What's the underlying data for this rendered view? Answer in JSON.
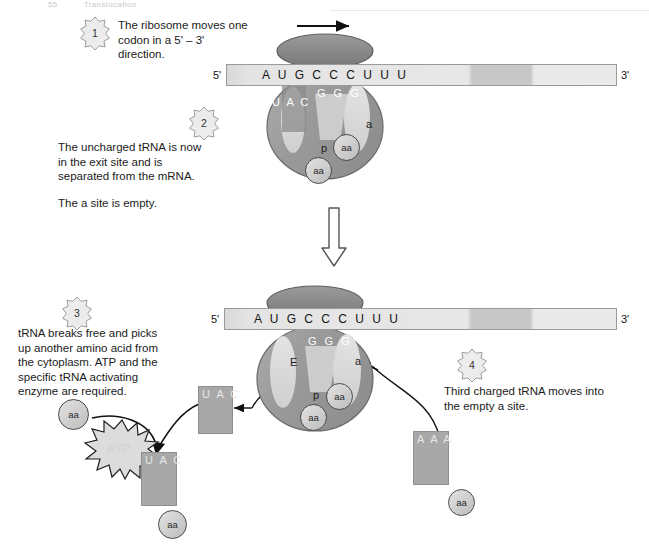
{
  "header": {
    "number": "55",
    "title": "Translocation"
  },
  "steps": [
    {
      "num": "1",
      "text": "The ribosome moves one\ncodon in a 5' – 3'\ndirection."
    },
    {
      "num": "2",
      "text": "The uncharged tRNA is now\nin the exit site and is\nseparated from the mRNA."
    },
    {
      "num": "3",
      "text": "tRNA breaks free and picks\nup another amino acid from\nthe cytoplasm. ATP and the\nspecific tRNA activating\nenzyme are required."
    },
    {
      "num": "4",
      "text": "Third charged tRNA moves into\nthe empty a site."
    }
  ],
  "extra_note": "The a site is empty.",
  "panel_top": {
    "mrna": {
      "five_prime": "5'",
      "three_prime": "3'",
      "sequence": "A U G C C C U U U"
    },
    "ribosome": {
      "codon_in_ribosome": "G G G",
      "exit_anticodon": "U A C",
      "p_site_label": "p",
      "a_site_label": "a",
      "aa_p": "aa",
      "aa_free": "aa"
    }
  },
  "panel_bottom": {
    "mrna": {
      "five_prime": "5'",
      "three_prime": "3'",
      "sequence": "A U G C C C U U U"
    },
    "ribosome": {
      "codon_in_ribosome": "G G G",
      "e_site_label": "E",
      "p_site_label": "p",
      "a_site_label": "a",
      "aa_p": "aa",
      "aa_free": "aa"
    },
    "released_trna": {
      "anticodon": "U A C"
    },
    "incoming_trna": {
      "anticodon": "A A A",
      "aa": "aa"
    },
    "recharge": {
      "free_aa": "aa",
      "atp_label": "ATP",
      "recharged_trna_anticodon": "U A C",
      "recharged_trna_aa": "aa"
    }
  },
  "colors": {
    "ribosome_body": "#9e9e9e",
    "ribosome_cap": "#8c8c8c",
    "site_fill": "#d9d9d9",
    "trna_fill": "#a8a8a8",
    "mrna_fill": "#e7e7e7",
    "outline": "#4a4a4a",
    "text": "#1b1b1b"
  }
}
